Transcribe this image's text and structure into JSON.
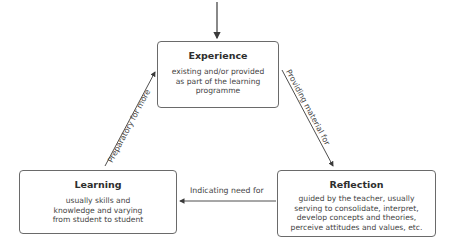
{
  "diagram": {
    "nodes": {
      "experience": {
        "title": "Experience",
        "description": "existing and/or provided as part of the learning programme"
      },
      "reflection": {
        "title": "Reflection",
        "description": "guided by the teacher, usually serving to consolidate, interpret, develop concepts and theories, perceive attitudes and values, etc."
      },
      "learning": {
        "title": "Learning",
        "description": "usually skills and knowledge and varying from student to student"
      }
    },
    "edges": {
      "experience_to_reflection": "Providing material for",
      "reflection_to_learning": "Indicating need for",
      "learning_to_experience": "Preparatory for more"
    },
    "colors": {
      "border": "#6a6a6a",
      "arrow": "#3a3a3a",
      "text": "#3a3a3a"
    }
  }
}
